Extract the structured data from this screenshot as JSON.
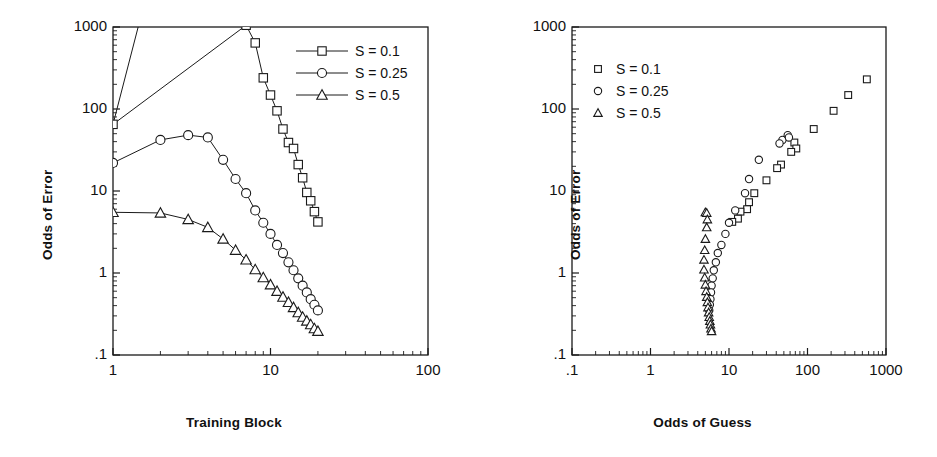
{
  "figure": {
    "background": "#ffffff",
    "ink": "#1a1a1a"
  },
  "chart_data": [
    {
      "id": "left",
      "type": "line",
      "title": "",
      "xlabel": "Training Block",
      "ylabel": "Odds of Error",
      "xscale": "log",
      "yscale": "log",
      "xlim": [
        1,
        100
      ],
      "ylim": [
        0.1,
        1000
      ],
      "xticks": [
        "1",
        "10",
        "100"
      ],
      "xtick_values": [
        1,
        10,
        100
      ],
      "yticks": [
        ".1",
        "1",
        "10",
        "100",
        "1000"
      ],
      "ytick_values": [
        0.1,
        1,
        10,
        100,
        1000
      ],
      "grid": false,
      "legend_position": "top-right-inside",
      "legend_style": "line-with-marker",
      "series": [
        {
          "name": "S = 0.1",
          "marker": "square",
          "x": [
            1,
            7,
            8,
            9,
            10,
            11,
            12,
            13,
            14,
            15,
            16,
            17,
            18,
            19,
            20
          ],
          "y": [
            65,
            1050,
            640,
            240,
            148,
            95,
            57,
            39,
            33,
            21,
            14.5,
            9.6,
            7.6,
            5.6,
            4.2
          ]
        },
        {
          "name": "S = 0.25",
          "marker": "circle",
          "x": [
            1,
            2,
            3,
            4,
            5,
            6,
            7,
            8,
            9,
            10,
            11,
            12,
            13,
            14,
            15,
            16,
            17,
            18,
            19,
            20
          ],
          "y": [
            22,
            42,
            48,
            45,
            24,
            14,
            9.4,
            5.8,
            4.1,
            3.0,
            2.2,
            1.75,
            1.35,
            1.08,
            0.86,
            0.7,
            0.58,
            0.48,
            0.41,
            0.35
          ]
        },
        {
          "name": "S = 0.5",
          "marker": "triangle",
          "x": [
            1,
            2,
            3,
            4,
            5,
            6,
            7,
            8,
            9,
            10,
            11,
            12,
            13,
            14,
            15,
            16,
            17,
            18,
            19,
            20
          ],
          "y": [
            5.5,
            5.4,
            4.5,
            3.6,
            2.6,
            1.9,
            1.45,
            1.1,
            0.88,
            0.72,
            0.6,
            0.51,
            0.44,
            0.38,
            0.33,
            0.29,
            0.26,
            0.235,
            0.21,
            0.195
          ]
        }
      ]
    },
    {
      "id": "right",
      "type": "scatter",
      "title": "",
      "xlabel": "Odds of Guess",
      "ylabel": "Odds of Error",
      "xscale": "log",
      "yscale": "log",
      "xlim": [
        0.1,
        1000
      ],
      "ylim": [
        0.1,
        1000
      ],
      "xticks": [
        ".1",
        "1",
        "10",
        "100",
        "1000"
      ],
      "xtick_values": [
        0.1,
        1,
        10,
        100,
        1000
      ],
      "yticks": [
        ".1",
        "1",
        "10",
        "100",
        "1000"
      ],
      "ytick_values": [
        0.1,
        1,
        10,
        100,
        1000
      ],
      "grid": false,
      "legend_position": "top-left-inside",
      "legend_style": "marker-only",
      "series": [
        {
          "name": "S = 0.1",
          "marker": "square",
          "x": [
            570,
            330,
            215,
            120,
            68,
            72,
            62,
            46,
            41,
            30,
            21,
            18,
            17,
            14,
            13,
            11
          ],
          "y": [
            230,
            148,
            95,
            57,
            39,
            33,
            30,
            21,
            19,
            13.5,
            9.4,
            7.3,
            6.0,
            5.6,
            4.6,
            4.2
          ]
        },
        {
          "name": "S = 0.25",
          "marker": "circle",
          "x": [
            48,
            56,
            58,
            44,
            24,
            18,
            16,
            12,
            10,
            9.0,
            8.0,
            7.2,
            6.8,
            6.4,
            6.2,
            6.0,
            5.9,
            5.8,
            5.7,
            5.6
          ],
          "y": [
            42,
            48,
            45,
            38,
            24,
            14,
            9.4,
            5.8,
            4.1,
            3.0,
            2.2,
            1.75,
            1.35,
            1.08,
            0.86,
            0.7,
            0.58,
            0.48,
            0.41,
            0.35
          ]
        },
        {
          "name": "S = 0.5",
          "marker": "triangle",
          "x": [
            5.0,
            5.2,
            5.3,
            5.2,
            5.0,
            4.9,
            4.8,
            4.8,
            4.9,
            5.0,
            5.1,
            5.2,
            5.3,
            5.4,
            5.5,
            5.6,
            5.7,
            5.8,
            5.9,
            6.0
          ],
          "y": [
            5.5,
            5.4,
            4.5,
            3.6,
            2.6,
            1.9,
            1.45,
            1.1,
            0.88,
            0.72,
            0.6,
            0.51,
            0.44,
            0.38,
            0.33,
            0.29,
            0.26,
            0.235,
            0.21,
            0.195
          ]
        }
      ]
    }
  ]
}
